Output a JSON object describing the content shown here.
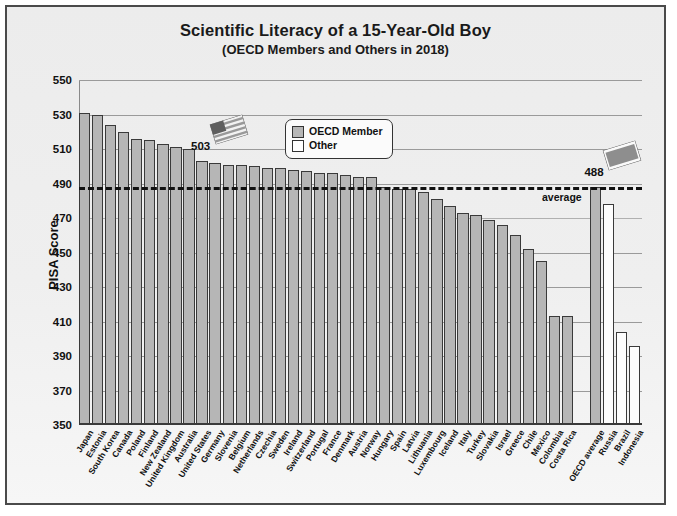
{
  "chart_data": {
    "type": "bar",
    "title": "Scientific Literacy of a 15-Year-Old Boy",
    "subtitle": "(OECD Members and Others in 2018)",
    "xlabel": "",
    "ylabel": "PISA Score",
    "ylim": [
      350,
      550
    ],
    "yticks": [
      350,
      370,
      390,
      410,
      430,
      450,
      470,
      490,
      510,
      530,
      550
    ],
    "grid": true,
    "legend_position": "top-center",
    "legend": [
      {
        "label": "OECD Member",
        "color": "#b6b6b6"
      },
      {
        "label": "Other",
        "color": "#ffffff"
      }
    ],
    "average_line": {
      "value": 488,
      "label": "average",
      "style": "dashed"
    },
    "categories": [
      "Japan",
      "Estonia",
      "South Korea",
      "Canada",
      "Poland",
      "Finland",
      "New Zealand",
      "United Kingdom",
      "Australia",
      "United States",
      "Germany",
      "Slovenia",
      "Belgium",
      "Netherlands",
      "Czechia",
      "Sweden",
      "Ireland",
      "Switzerland",
      "Portugal",
      "France",
      "Denmark",
      "Austria",
      "Norway",
      "Hungary",
      "Spain",
      "Latvia",
      "Lithuania",
      "Luxembourg",
      "Iceland",
      "Italy",
      "Turkey",
      "Slovakia",
      "Israel",
      "Greece",
      "Chile",
      "Mexico",
      "Colombia",
      "Costa Rica",
      "OECD average",
      "Russia",
      "Brazil",
      "Indonesia"
    ],
    "values": [
      531,
      530,
      524,
      520,
      516,
      515,
      513,
      511,
      510,
      503,
      502,
      501,
      501,
      500,
      499,
      499,
      498,
      497,
      496,
      496,
      495,
      494,
      494,
      488,
      487,
      487,
      485,
      481,
      477,
      473,
      472,
      469,
      466,
      460,
      452,
      445,
      413,
      413,
      488,
      478,
      404,
      396
    ],
    "groups": [
      "OECD Member",
      "OECD Member",
      "OECD Member",
      "OECD Member",
      "OECD Member",
      "OECD Member",
      "OECD Member",
      "OECD Member",
      "OECD Member",
      "OECD Member",
      "OECD Member",
      "OECD Member",
      "OECD Member",
      "OECD Member",
      "OECD Member",
      "OECD Member",
      "OECD Member",
      "OECD Member",
      "OECD Member",
      "OECD Member",
      "OECD Member",
      "OECD Member",
      "OECD Member",
      "OECD Member",
      "OECD Member",
      "OECD Member",
      "OECD Member",
      "OECD Member",
      "OECD Member",
      "OECD Member",
      "OECD Member",
      "OECD Member",
      "OECD Member",
      "OECD Member",
      "OECD Member",
      "OECD Member",
      "OECD Member",
      "OECD Member",
      "OECD Member",
      "Other",
      "Other",
      "Other"
    ],
    "annotations": [
      {
        "name": "us-flag-callout",
        "text": "503",
        "category": "United States",
        "icon": "us-flag-icon"
      },
      {
        "name": "oecd-average-callout",
        "text": "488",
        "category": "OECD average",
        "icon": "oecd-flag-icon"
      }
    ]
  }
}
